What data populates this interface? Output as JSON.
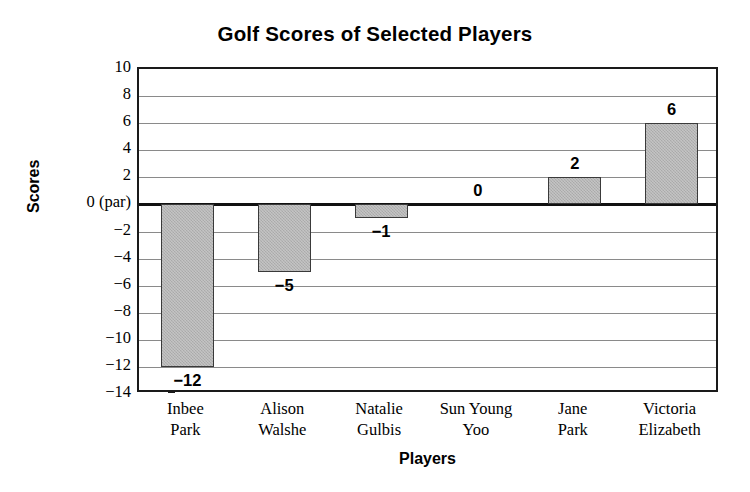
{
  "chart_data": {
    "type": "bar",
    "title": "Golf Scores of Selected Players",
    "xlabel": "Players",
    "ylabel": "Scores",
    "categories": [
      "Inbee Park",
      "Alison Walshe",
      "Natalie Gulbis",
      "Sun Young Yoo",
      "Jane Park",
      "Victoria Elizabeth"
    ],
    "category_lines": [
      [
        "Inbee",
        "Park"
      ],
      [
        "Alison",
        "Walshe"
      ],
      [
        "Natalie",
        "Gulbis"
      ],
      [
        "Sun Young",
        "Yoo"
      ],
      [
        "Jane",
        "Park"
      ],
      [
        "Victoria",
        "Elizabeth"
      ]
    ],
    "values": [
      -12,
      -5,
      -1,
      0,
      2,
      6
    ],
    "value_labels": [
      "−12",
      "−5",
      "−1",
      "0",
      "2",
      "6"
    ],
    "ylim": [
      -14,
      10
    ],
    "ytick_values": [
      10,
      8,
      6,
      4,
      2,
      0,
      -2,
      -4,
      -6,
      -8,
      -10,
      -12,
      -14
    ],
    "ytick_labels": [
      "10",
      "8",
      "6",
      "4",
      "2",
      "0 (par)",
      "−2",
      "−4",
      "−6",
      "−8",
      "−10",
      "−12",
      "−14"
    ],
    "grid": true,
    "legend": null,
    "bar_color": "#b3b3b3",
    "bar_edge_color": "#3a3a3a",
    "axis_color": "#1a1a1a",
    "grid_color": "#8a8a8a",
    "background_color": "#ffffff",
    "zero_reference": 0
  }
}
